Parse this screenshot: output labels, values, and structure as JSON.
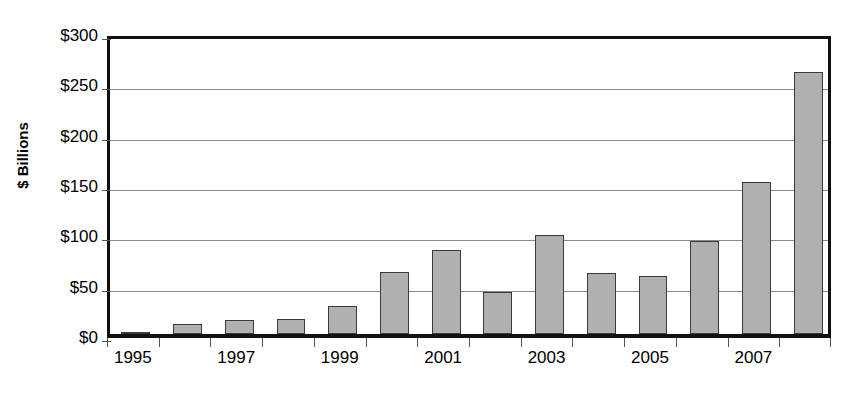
{
  "chart_data": {
    "type": "bar",
    "title": "",
    "xlabel": "",
    "ylabel": "$ Billions",
    "ylim": [
      0,
      300
    ],
    "ytick_values": [
      0,
      50,
      100,
      150,
      200,
      250,
      300
    ],
    "ytick_labels": [
      "$0",
      "$50",
      "$100",
      "$150",
      "$200",
      "$250",
      "$300"
    ],
    "grid": true,
    "legend": "none",
    "categories": [
      "1995",
      "1996",
      "1997",
      "1998",
      "1999",
      "2000",
      "2001",
      "2002",
      "2003",
      "2004",
      "2005",
      "2006",
      "2007",
      "2008"
    ],
    "xtick_labels_shown": [
      "1995",
      "1997",
      "1999",
      "2001",
      "2003",
      "2005",
      "2007"
    ],
    "values": [
      2,
      10,
      14,
      15,
      28,
      62,
      83,
      42,
      98,
      61,
      58,
      92,
      151,
      260
    ],
    "colors": {
      "bar_fill": "#b0b0b0",
      "bar_border": "#3a3a3a",
      "axis": "#111111",
      "gridline": "#8a8a8a",
      "text": "#000000",
      "background": "#ffffff"
    }
  }
}
